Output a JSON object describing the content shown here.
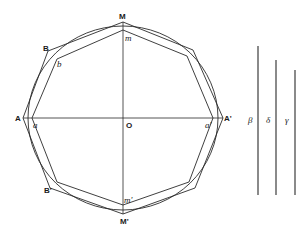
{
  "diagram": {
    "labels": {
      "M": "M",
      "m": "m",
      "B": "B",
      "b": "b",
      "A": "A",
      "a": "a",
      "O": "O",
      "A_prime": "A'",
      "a_prime": "a'",
      "B_prime": "B'",
      "m_prime": "m'",
      "M_prime": "M'",
      "beta": "β",
      "delta": "δ",
      "gamma": "γ"
    },
    "segments": [
      {
        "name": "beta",
        "label": "β"
      },
      {
        "name": "delta",
        "label": "δ"
      },
      {
        "name": "gamma",
        "label": "γ"
      }
    ],
    "colors": {
      "line": "#2a2a2a",
      "background": "#ffffff"
    }
  }
}
